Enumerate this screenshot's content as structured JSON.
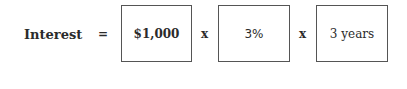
{
  "equation": {
    "lhs": "Interest",
    "equals": "=",
    "terms": [
      {
        "value": "$1,000"
      },
      {
        "value": "3%"
      },
      {
        "value": "3 years"
      }
    ],
    "operators": [
      "x",
      "x"
    ]
  }
}
